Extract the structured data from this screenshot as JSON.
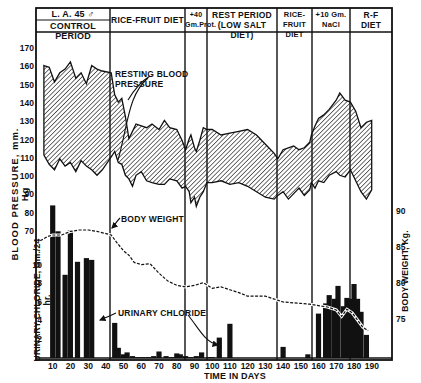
{
  "chart_data": {
    "type": "multi-panel line/area + bar",
    "title": "L. A. 45 ♂",
    "xlabel": "TIME IN DAYS",
    "x_ticks": [
      10,
      20,
      30,
      40,
      50,
      60,
      70,
      80,
      90,
      100,
      110,
      120,
      130,
      140,
      150,
      160,
      170,
      180,
      190
    ],
    "xlim": [
      0,
      200
    ],
    "periods": [
      {
        "label": "L. A. 45 ♂ / CONTROL PERIOD",
        "line1": "L. A. 45  ♂",
        "line2": "CONTROL PERIOD",
        "start_day": 0,
        "end_day": 43
      },
      {
        "label": "RICE-FRUIT DIET",
        "line1": "RICE-FRUIT DIET",
        "line2": "",
        "start_day": 43,
        "end_day": 85
      },
      {
        "label": "+40 Gm.Prot.",
        "line1": "+40",
        "line2": "Gm.Prot.",
        "start_day": 85,
        "end_day": 97
      },
      {
        "label": "REST PERIOD (LOW SALT DIET)",
        "line1": "REST PERIOD",
        "line2": "(LOW SALT DIET)",
        "start_day": 97,
        "end_day": 137
      },
      {
        "label": "RICE-FRUIT DIET",
        "line1": "RICE-FRUIT",
        "line2": "DIET",
        "start_day": 137,
        "end_day": 156
      },
      {
        "label": "+10 Gm. NaCl",
        "line1": "+10 Gm.",
        "line2": "NaCl",
        "start_day": 156,
        "end_day": 178
      },
      {
        "label": "R-F DIET",
        "line1": "R-F",
        "line2": "DIET",
        "start_day": 178,
        "end_day": 200
      }
    ],
    "panels": [
      {
        "name": "Resting Blood Pressure",
        "type": "area",
        "ylabel": "BLOOD PRESSURE, mm. Hg",
        "y_ticks": [
          70,
          80,
          90,
          100,
          110,
          120,
          130,
          140,
          150,
          160,
          170
        ],
        "ylim": [
          70,
          170
        ],
        "annotation": "RESTING BLOOD PRESSURE",
        "series": [
          {
            "name": "Systolic",
            "x": [
              5,
              8,
              11,
              14,
              17,
              20,
              23,
              26,
              29,
              32,
              35,
              38,
              43,
              45,
              47,
              49,
              51,
              53,
              55,
              57,
              60,
              63,
              66,
              70,
              73,
              76,
              80,
              83,
              85,
              87,
              88,
              90,
              91,
              93,
              95,
              97,
              100,
              105,
              110,
              115,
              120,
              125,
              130,
              135,
              137,
              140,
              143,
              146,
              149,
              152,
              155,
              156,
              158,
              160,
              163,
              166,
              170,
              172,
              175,
              178,
              181,
              184,
              187,
              190
            ],
            "values": [
              161,
              160,
              152,
              157,
              159,
              163,
              154,
              157,
              151,
              161,
              159,
              158,
              157,
              145,
              141,
              143,
              133,
              121,
              125,
              129,
              128,
              127,
              129,
              126,
              131,
              127,
              126,
              120,
              115,
              121,
              123,
              116,
              114,
              120,
              127,
              126,
              126,
              123,
              124,
              125,
              126,
              123,
              118,
              113,
              110,
              115,
              116,
              117,
              115,
              116,
              119,
              123,
              128,
              132,
              134,
              137,
              142,
              146,
              142,
              141,
              136,
              127,
              130,
              131
            ]
          },
          {
            "name": "Diastolic",
            "x": [
              5,
              8,
              11,
              14,
              17,
              20,
              23,
              26,
              29,
              32,
              35,
              38,
              43,
              45,
              47,
              49,
              51,
              53,
              55,
              57,
              60,
              63,
              66,
              70,
              73,
              76,
              80,
              83,
              85,
              87,
              88,
              90,
              91,
              93,
              95,
              97,
              100,
              105,
              110,
              115,
              120,
              125,
              130,
              135,
              137,
              140,
              143,
              146,
              149,
              152,
              155,
              156,
              158,
              160,
              163,
              166,
              170,
              172,
              175,
              178,
              181,
              184,
              187,
              190
            ],
            "values": [
              112,
              107,
              104,
              110,
              106,
              108,
              103,
              109,
              106,
              104,
              101,
              104,
              111,
              114,
              108,
              107,
              101,
              99,
              95,
              101,
              103,
              98,
              97,
              96,
              96,
              99,
              98,
              94,
              95,
              92,
              86,
              89,
              84,
              89,
              92,
              97,
              97,
              98,
              96,
              97,
              95,
              92,
              89,
              88,
              90,
              92,
              88,
              91,
              94,
              90,
              93,
              97,
              94,
              98,
              97,
              101,
              103,
              101,
              100,
              104,
              98,
              92,
              88,
              93
            ]
          }
        ]
      },
      {
        "name": "Body Weight",
        "type": "line",
        "ylabel": "BODY WEIGHT, Kg.",
        "y_ticks": [
          75,
          80,
          85,
          90
        ],
        "ylim": [
          72.5,
          92.5
        ],
        "annotation": "BODY WEIGHT",
        "series": [
          {
            "name": "Body weight (dashed)",
            "x": [
              3,
              7,
              10,
              15,
              20,
              25,
              30,
              35,
              40,
              43,
              46,
              50,
              53,
              56,
              60,
              65,
              70,
              75,
              80,
              85,
              90,
              95,
              100,
              105,
              110,
              115,
              120,
              130,
              140,
              150,
              155,
              160,
              165,
              170,
              173,
              176,
              179,
              182,
              185,
              188
            ],
            "values": [
              86.0,
              86.6,
              86.8,
              86.8,
              87.3,
              87.5,
              87.5,
              87.3,
              87.0,
              86.8,
              85.8,
              84.6,
              84.0,
              83.0,
              82.7,
              82.8,
              81.5,
              80.4,
              79.8,
              79.6,
              79.8,
              80.2,
              79.4,
              79.6,
              79.2,
              78.8,
              78.3,
              78.3,
              77.5,
              77.3,
              77.2,
              77.0,
              76.8,
              76.4,
              75.5,
              76.5,
              76.0,
              75.0,
              74.0,
              73.5
            ]
          }
        ]
      },
      {
        "name": "Urinary Chloride",
        "type": "bar",
        "ylabel": "URINARY CHLORIDE, Gm./24 hr.",
        "y_ticks": [
          2,
          4,
          6,
          8,
          10
        ],
        "ylim": [
          0,
          19
        ],
        "annotation": "URINARY CHLORIDE",
        "series": [
          {
            "name": "Urinary chloride",
            "x": [
              10,
              13,
              17,
              20,
              24,
              29,
              32,
              45,
              47,
              50,
              52,
              55,
              58,
              61,
              64,
              67,
              70,
              74,
              77,
              80,
              82,
              85,
              88,
              91,
              94,
              98,
              100,
              104,
              110,
              140,
              154,
              160,
              164,
              166,
              169,
              171,
              174,
              176,
              178,
              180,
              182,
              184,
              187
            ],
            "values": [
              16.5,
              13.7,
              9.0,
              13.8,
              10.4,
              10.8,
              10.6,
              3.8,
              1.1,
              0.4,
              0.6,
              0.2,
              0.1,
              0.1,
              0.1,
              0.2,
              0.7,
              0.2,
              0.1,
              0.5,
              0.4,
              0.2,
              0.1,
              0.2,
              0.6,
              0.1,
              0.1,
              2.2,
              3.7,
              1.2,
              0.4,
              4.8,
              5.9,
              6.8,
              6.4,
              7.8,
              5.6,
              6.5,
              6.4,
              8.0,
              6.4,
              5.0,
              2.5
            ]
          }
        ]
      }
    ],
    "grid": false,
    "legend": "none (inline annotations with arrows)"
  },
  "labels": {
    "bp_axis": "BLOOD PRESSURE, mm. Hg",
    "bw_axis": "BODY WEIGHT, Kg.",
    "uc_axis": "URINARY CHLORIDE, Gm./24 hr.",
    "x_axis": "TIME IN DAYS",
    "bp_annotation": "RESTING BLOOD PRESSURE",
    "bw_annotation": "BODY WEIGHT",
    "uc_annotation": "URINARY CHLORIDE"
  }
}
